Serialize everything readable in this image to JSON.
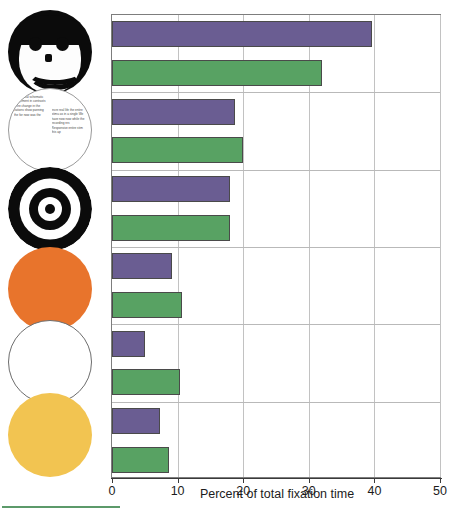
{
  "chart_data": {
    "type": "bar",
    "orientation": "horizontal",
    "title": "",
    "xlabel": "Percent of total fixation time",
    "ylabel": "",
    "xlim": [
      0,
      50
    ],
    "xticks": [
      0,
      10,
      20,
      30,
      40,
      50
    ],
    "xticklabels": [
      "0",
      "10",
      "20",
      "30",
      "40",
      "50"
    ],
    "grid": true,
    "grid_axis": "x",
    "legend": "none",
    "categories": [
      "schematic-face",
      "printed-text",
      "bullseye-target",
      "orange-disc",
      "white-disc",
      "yellow-disc"
    ],
    "series": [
      {
        "name": "purple",
        "color": "#6a5d92",
        "values": [
          39.7,
          18.7,
          18.0,
          9.2,
          5.0,
          7.3
        ]
      },
      {
        "name": "green",
        "color": "#58a263",
        "values": [
          32.0,
          20.0,
          18.0,
          10.6,
          10.3,
          8.7
        ]
      }
    ],
    "bars": [
      {
        "index": 1,
        "series": "purple",
        "category": "schematic-face",
        "value": 39.7
      },
      {
        "index": 2,
        "series": "green",
        "category": "schematic-face",
        "value": 32.0
      },
      {
        "index": 3,
        "series": "purple",
        "category": "printed-text",
        "value": 18.7
      },
      {
        "index": 4,
        "series": "green",
        "category": "printed-text",
        "value": 20.0
      },
      {
        "index": 5,
        "series": "purple",
        "category": "bullseye-target",
        "value": 18.0
      },
      {
        "index": 6,
        "series": "green",
        "category": "bullseye-target",
        "value": 18.0
      },
      {
        "index": 7,
        "series": "purple",
        "category": "orange-disc",
        "value": 9.2
      },
      {
        "index": 8,
        "series": "green",
        "category": "orange-disc",
        "value": 10.6
      },
      {
        "index": 9,
        "series": "purple",
        "category": "white-disc",
        "value": 5.0
      },
      {
        "index": 10,
        "series": "green",
        "category": "white-disc",
        "value": 10.3
      },
      {
        "index": 11,
        "series": "purple",
        "category": "yellow-disc",
        "value": 7.3
      },
      {
        "index": 12,
        "series": "green",
        "category": "yellow-disc",
        "value": 8.7
      }
    ]
  },
  "stimuli": [
    {
      "name": "schematic-face",
      "label": "schematic face",
      "kind": "face"
    },
    {
      "name": "printed-text",
      "label": "printed text",
      "kind": "text"
    },
    {
      "name": "bullseye-target",
      "label": "bullseye target",
      "kind": "bullseye"
    },
    {
      "name": "orange-disc",
      "label": "orange disc",
      "kind": "disc",
      "color": "#e8742c"
    },
    {
      "name": "white-disc",
      "label": "white disc",
      "kind": "disc",
      "color": "#ffffff"
    },
    {
      "name": "yellow-disc",
      "label": "yellow disc",
      "kind": "disc",
      "color": "#f2c451"
    }
  ],
  "text_circle": {
    "column_one": "of a of real schematic rangement in contrasts were change in the vations show panning the for now was the",
    "column_two": "incre real life the entire stimu as in a single We have now now while the recording res Responsive entire stim this ap"
  },
  "colors": {
    "purple": "#6a5d92",
    "green": "#58a263",
    "orange": "#e8742c",
    "yellow": "#f2c451",
    "frame": "#7d7d7d",
    "grid": "#c2c2c2",
    "footrule": "#5c9a6a"
  }
}
